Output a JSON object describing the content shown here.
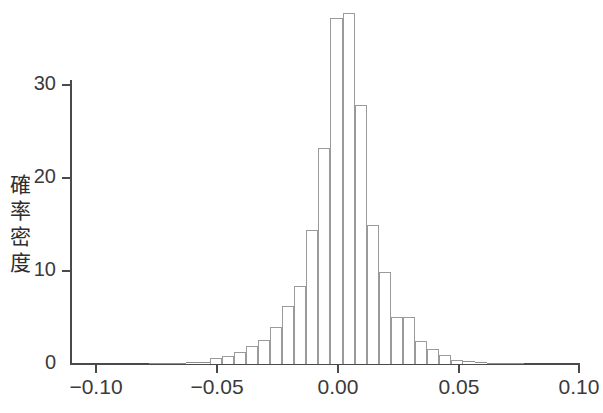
{
  "figure": {
    "background_color": "#ffffff",
    "axis_color": "#4a4a4a",
    "bar_edge_color": "#9a9a9a",
    "bar_fill_color": "#ffffff"
  },
  "axes": {
    "y_title": "確率密度",
    "y_ticks": [
      "0",
      "10",
      "20",
      "30"
    ],
    "x_ticks": [
      "−0.10",
      "−0.05",
      "0.00",
      "0.05",
      "0.10"
    ]
  },
  "chart_data": {
    "type": "bar",
    "title": "",
    "subtitle": "",
    "xlabel": "",
    "ylabel": "確率密度",
    "legend": [],
    "grid": false,
    "xlim": [
      -0.105,
      0.105
    ],
    "ylim": [
      0,
      38
    ],
    "xtick_values": [
      -0.1,
      -0.05,
      0.0,
      0.05,
      0.1
    ],
    "xtick_labels": [
      "−0.10",
      "−0.05",
      "0.00",
      "0.05",
      "0.10"
    ],
    "ytick_values": [
      0,
      10,
      20,
      30
    ],
    "ytick_labels": [
      "0",
      "10",
      "20",
      "30"
    ],
    "bin_width": 0.005,
    "bin_left_edges": [
      -0.0775,
      -0.0725,
      -0.0675,
      -0.0625,
      -0.0575,
      -0.0525,
      -0.0475,
      -0.0425,
      -0.0375,
      -0.0325,
      -0.0275,
      -0.0225,
      -0.0175,
      -0.0125,
      -0.0075,
      -0.0025,
      0.0025,
      0.0075,
      0.0125,
      0.0175,
      0.0225,
      0.0275,
      0.0325,
      0.0375,
      0.0425,
      0.0475,
      0.0525,
      0.0575,
      0.0625,
      0.0675,
      0.0725
    ],
    "bin_centers": [
      -0.075,
      -0.07,
      -0.065,
      -0.06,
      -0.055,
      -0.05,
      -0.045,
      -0.04,
      -0.035,
      -0.03,
      -0.025,
      -0.02,
      -0.015,
      -0.01,
      -0.005,
      0.0,
      0.005,
      0.01,
      0.015,
      0.02,
      0.025,
      0.03,
      0.035,
      0.04,
      0.045,
      0.05,
      0.055,
      0.06,
      0.065,
      0.07,
      0.075
    ],
    "categories": [
      "-0.075",
      "-0.070",
      "-0.065",
      "-0.060",
      "-0.055",
      "-0.050",
      "-0.045",
      "-0.040",
      "-0.035",
      "-0.030",
      "-0.025",
      "-0.020",
      "-0.015",
      "-0.010",
      "-0.005",
      "0.000",
      "0.005",
      "0.010",
      "0.015",
      "0.020",
      "0.025",
      "0.030",
      "0.035",
      "0.040",
      "0.045",
      "0.050",
      "0.055",
      "0.060",
      "0.065",
      "0.070",
      "0.075"
    ],
    "values": [
      0.15,
      0.15,
      0.15,
      0.2,
      0.2,
      0.6,
      0.9,
      1.3,
      1.9,
      2.6,
      4.0,
      6.2,
      8.4,
      14.4,
      23.2,
      37.2,
      37.7,
      27.8,
      15.0,
      9.9,
      5.1,
      5.1,
      2.5,
      1.6,
      1.0,
      0.45,
      0.3,
      0.2,
      0.15,
      0.15,
      0.15
    ]
  }
}
